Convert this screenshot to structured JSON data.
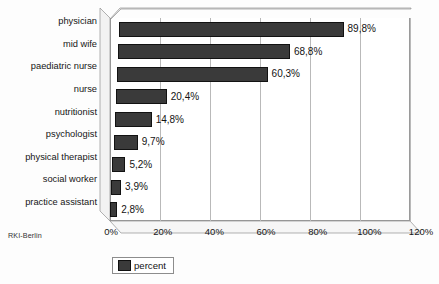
{
  "source": {
    "label": "RKI-Berlin"
  },
  "legend": {
    "series_label": "percent",
    "position": "bottom"
  },
  "chart_data": {
    "type": "bar",
    "orientation": "horizontal",
    "title": "",
    "subtitle": "",
    "xlabel": "",
    "ylabel": "",
    "xlim": [
      0,
      120
    ],
    "grid": true,
    "value_suffix": "%",
    "decimal_separator": ",",
    "legend_position": "bottom",
    "legend_entries": [
      "percent"
    ],
    "series_name": "percent",
    "categories": [
      "physician",
      "mid wife",
      "paediatric nurse",
      "nurse",
      "nutritionist",
      "psychologist",
      "physical therapist",
      "social worker",
      "practice assistant"
    ],
    "values": [
      89.8,
      68.8,
      60.3,
      20.4,
      14.8,
      9.7,
      5.2,
      3.9,
      2.8
    ],
    "value_labels": [
      "89,8%",
      "68,8%",
      "60,3%",
      "20,4%",
      "14,8%",
      "9,7%",
      "5,2%",
      "3,9%",
      "2,8%"
    ],
    "xticks": [
      0,
      20,
      40,
      60,
      80,
      100,
      120
    ],
    "xtick_labels": [
      "0%",
      "20%",
      "40%",
      "60%",
      "80%",
      "100%",
      "120%"
    ],
    "colors": {
      "bar": "#3a3a3a",
      "bar_edge": "#121212",
      "grid": "#b9b9b9",
      "plot_bg": "#ffffff",
      "page_bg": "#fdfdfd"
    }
  }
}
